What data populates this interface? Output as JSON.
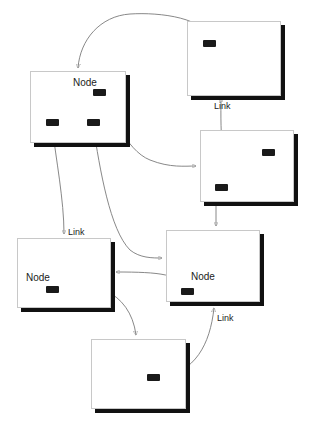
{
  "diagram": {
    "colors": {
      "background": "#ffffff",
      "node_fill": "#ffffff",
      "node_border": "#c8c8c8",
      "node_shadow": "#111111",
      "port": "#1a1a1a",
      "edge": "#7a7a7a"
    },
    "nodes": [
      {
        "id": "n1",
        "label": "Node",
        "x": 30,
        "y": 71,
        "w": 96,
        "h": 72,
        "label_x": 42,
        "label_y": 5,
        "ports": [
          {
            "x": 62,
            "y": 17
          },
          {
            "x": 15,
            "y": 47
          },
          {
            "x": 56,
            "y": 47
          }
        ]
      },
      {
        "id": "n2",
        "label": "",
        "x": 187,
        "y": 21,
        "w": 94,
        "h": 75,
        "label_x": 0,
        "label_y": 0,
        "ports": [
          {
            "x": 15,
            "y": 18
          }
        ]
      },
      {
        "id": "n3",
        "label": "",
        "x": 200,
        "y": 130,
        "w": 94,
        "h": 72,
        "label_x": 0,
        "label_y": 0,
        "ports": [
          {
            "x": 61,
            "y": 18
          },
          {
            "x": 14,
            "y": 53
          }
        ]
      },
      {
        "id": "n4",
        "label": "Node",
        "x": 17,
        "y": 238,
        "w": 94,
        "h": 70,
        "label_x": 8,
        "label_y": 33,
        "ports": [
          {
            "x": 28,
            "y": 47
          }
        ]
      },
      {
        "id": "n5",
        "label": "Node",
        "x": 166,
        "y": 230,
        "w": 94,
        "h": 72,
        "label_x": 24,
        "label_y": 40,
        "ports": [
          {
            "x": 14,
            "y": 57
          }
        ]
      },
      {
        "id": "n6",
        "label": "",
        "x": 91,
        "y": 339,
        "w": 95,
        "h": 70,
        "label_x": 0,
        "label_y": 0,
        "ports": [
          {
            "x": 55,
            "y": 34
          }
        ]
      }
    ],
    "link_labels": [
      {
        "text": "Link",
        "x": 214,
        "y": 101
      },
      {
        "text": "Link",
        "x": 68,
        "y": 227
      },
      {
        "text": "Link",
        "x": 217,
        "y": 313
      }
    ],
    "edges": [
      {
        "from": "n2.port0",
        "to": "n1.top",
        "d": "M209,41 C208,18 160,12 130,14 C100,16 80,40 78,68",
        "arrow": "down"
      },
      {
        "from": "n1.port0",
        "to": "n3.left",
        "d": "M99,95 C112,110 125,150 150,160 C170,168 185,166 196,166",
        "arrow": "right"
      },
      {
        "from": "n1.port1",
        "to": "n4.top",
        "d": "M52,125 C56,160 64,200 64,234",
        "arrow": "down"
      },
      {
        "from": "n1.port2",
        "to": "n5.left",
        "d": "M93,125 C100,170 110,230 130,250 C140,258 152,258 162,258",
        "arrow": "right"
      },
      {
        "from": "n3.port1",
        "to": "n2.bottom",
        "d": "M220,190 C215,180 218,170 222,170 C226,170 220,150 221,102 C221,100 221,98 221,98",
        "arrow": "up"
      },
      {
        "from": "n3.port1",
        "to": "n5.top",
        "d": "M216,186 L216,226",
        "arrow": "down"
      },
      {
        "from": "n5.left",
        "to": "n4.right",
        "d": "M188,290 C180,274 160,272 116,272",
        "arrow": "left"
      },
      {
        "from": "n4.port0",
        "to": "n6.top",
        "d": "M52,288 C90,278 130,290 136,335",
        "arrow": "down"
      },
      {
        "from": "n6.port0",
        "to": "n5.bottom",
        "d": "M160,378 C195,372 210,345 214,308",
        "arrow": "up"
      }
    ]
  }
}
